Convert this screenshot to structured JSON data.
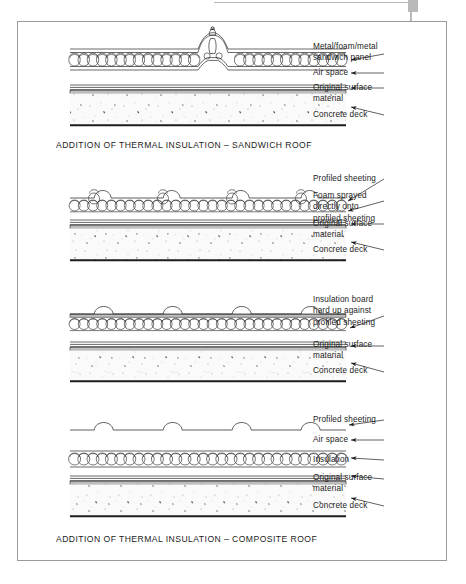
{
  "page": {
    "background_color": "#ffffff",
    "frame_border_color": "#9a9a9a",
    "corner_mark_color": "#b9b9b9",
    "ink_color": "#1c1c1c",
    "deck_fill_color": "#fafafa",
    "surface_band_color": "#bdbdbd"
  },
  "figures": [
    {
      "id": "sandwich-roof",
      "caption": "ADDITION OF THERMAL INSULATION – SANDWICH ROOF",
      "labels": [
        {
          "text": "Metal/foam/metal\nsandwich panel",
          "lines": 2
        },
        {
          "text": "Air space",
          "lines": 1
        },
        {
          "text": "Original surface\nmaterial",
          "lines": 2
        },
        {
          "text": "Concrete deck",
          "lines": 1
        }
      ],
      "layers": [
        "metal-foam-metal sandwich panel with standing seam",
        "air space",
        "original surface material",
        "concrete deck"
      ]
    },
    {
      "id": "foam-sprayed-roof",
      "caption": "",
      "labels": [
        {
          "text": "Profiled sheeting",
          "lines": 1
        },
        {
          "text": "Foam sprayed\ndirectly onto\nprofiled sheeting",
          "lines": 3
        },
        {
          "text": "Original surface\nmaterial",
          "lines": 2
        },
        {
          "text": "Concrete deck",
          "lines": 1
        }
      ],
      "layers": [
        "profiled sheeting",
        "foam sprayed directly onto profiled sheeting",
        "original surface material",
        "concrete deck"
      ]
    },
    {
      "id": "insulation-board-roof",
      "caption": "",
      "labels": [
        {
          "text": "Insulation board\nhard up against\nprofiled sheeting",
          "lines": 3
        },
        {
          "text": "Original surface\nmaterial",
          "lines": 2
        },
        {
          "text": "Concrete deck",
          "lines": 1
        }
      ],
      "layers": [
        "profiled sheeting",
        "insulation board hard up against profiled sheeting",
        "original surface material",
        "concrete deck"
      ]
    },
    {
      "id": "composite-roof",
      "caption": "ADDITION OF THERMAL INSULATION – COMPOSITE ROOF",
      "labels": [
        {
          "text": "Profiled sheeting",
          "lines": 1
        },
        {
          "text": "Air space",
          "lines": 1
        },
        {
          "text": "Insulation",
          "lines": 1
        },
        {
          "text": "Original surface\nmaterial",
          "lines": 2
        },
        {
          "text": "Concrete deck",
          "lines": 1
        }
      ],
      "layers": [
        "profiled sheeting",
        "air space",
        "insulation",
        "original surface material",
        "concrete deck"
      ]
    }
  ]
}
